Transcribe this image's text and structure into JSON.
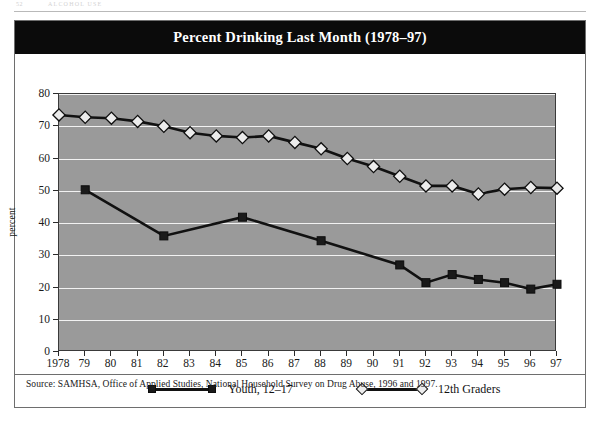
{
  "page_header": {
    "folio": "52",
    "running_head": "ALCOHOL USE"
  },
  "figure": {
    "title": "Percent Drinking Last Month (1978–97)",
    "source": "Source: SAMHSA, Office of Applied Studies, National Household Survey on Drug Abuse, 1996 and 1997."
  },
  "colors": {
    "banner_background": "#0b0b0b",
    "banner_text": "#ffffff",
    "plot_background": "#9a9a9a",
    "gridline": "#f2f2f2",
    "series_line": "#111111",
    "youth_marker_fill": "#1a1a1a",
    "graders_marker_fill": "#ececec",
    "frame_border": "#6e6e6e"
  },
  "legend": {
    "position": "below-axis",
    "entries": [
      {
        "label": "Youth, 12–17",
        "marker": "filled-square-marker",
        "marker_shape": "square"
      },
      {
        "label": "12th Graders",
        "marker": "open-diamond-marker",
        "marker_shape": "diamond"
      }
    ]
  },
  "chart_data": {
    "type": "line",
    "title": "Percent Drinking Last Month (1978–97)",
    "xlabel": "",
    "ylabel": "percent",
    "ylim": [
      0,
      80
    ],
    "ytick_step": 10,
    "yticks": [
      0,
      10,
      20,
      30,
      40,
      50,
      60,
      70,
      80
    ],
    "grid": true,
    "x": [
      1978,
      1979,
      1980,
      1981,
      1982,
      1983,
      1984,
      1985,
      1986,
      1987,
      1988,
      1989,
      1990,
      1991,
      1992,
      1993,
      1994,
      1995,
      1996,
      1997
    ],
    "xtick_labels": [
      "1978",
      "79",
      "80",
      "81",
      "82",
      "83",
      "84",
      "85",
      "86",
      "87",
      "88",
      "89",
      "90",
      "91",
      "92",
      "93",
      "94",
      "95",
      "96",
      "97"
    ],
    "series": [
      {
        "name": "Youth, 12–17",
        "marker": "square",
        "x": [
          1979,
          1982,
          1985,
          1988,
          1991,
          1992,
          1993,
          1994,
          1995,
          1996,
          1997
        ],
        "values": [
          50.3,
          36.0,
          41.8,
          34.5,
          27.0,
          21.5,
          24.0,
          22.5,
          21.5,
          19.5,
          21.0
        ]
      },
      {
        "name": "12th Graders",
        "marker": "diamond",
        "x": [
          1978,
          1979,
          1980,
          1981,
          1982,
          1983,
          1984,
          1985,
          1986,
          1987,
          1988,
          1989,
          1990,
          1991,
          1992,
          1993,
          1994,
          1995,
          1996,
          1997
        ],
        "values": [
          73.5,
          72.8,
          72.5,
          71.5,
          70.0,
          68.0,
          67.0,
          66.5,
          67.0,
          65.0,
          63.0,
          60.0,
          57.5,
          54.5,
          51.5,
          51.5,
          49.0,
          50.5,
          51.0,
          50.8
        ]
      }
    ]
  }
}
